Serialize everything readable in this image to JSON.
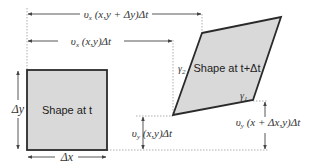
{
  "diagram": {
    "type": "shear-deformation",
    "colors": {
      "shape_fill": "#d9d9d9",
      "shape_stroke": "#2a2a2a",
      "guide_line": "#888888",
      "arrow": "#444444"
    },
    "shape_t": {
      "label": "Shape at t",
      "width_label": "Δx",
      "height_label": "Δy"
    },
    "shape_t_dt": {
      "label": "Shape at t+Δt",
      "angle_top_label": "γ2",
      "angle_bottom_label": "γ1"
    },
    "displacements": {
      "vx_top": "υx (x,y + Δy)Δt",
      "vx_bottom": "υx (x,y)Δt",
      "vy_left": "υy (x,y)Δt",
      "vy_right": "υy (x + Δx,y)Δt"
    },
    "displacement_parts": {
      "vx_top": {
        "sym": "υ",
        "sub": "x",
        "rest": " (x,y + Δy)Δt"
      },
      "vx_bottom": {
        "sym": "υ",
        "sub": "x",
        "rest": " (x,y)Δt"
      },
      "vy_left": {
        "sym": "υ",
        "sub": "y",
        "rest": " (x,y)Δt"
      },
      "vy_right": {
        "sym": "υ",
        "sub": "y",
        "rest": " (x + Δx,y)Δt"
      }
    },
    "gamma": {
      "sym": "γ",
      "sub1": "1",
      "sub2": "2"
    }
  }
}
